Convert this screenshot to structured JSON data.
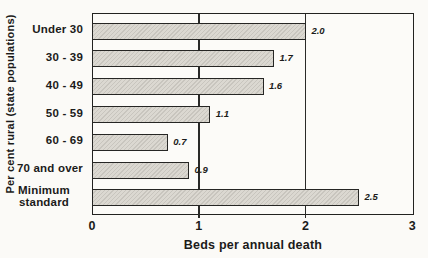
{
  "colors": {
    "paper": "#fbfaf7",
    "ink": "#1e1e1e",
    "bar_fill": "#dbd8d1",
    "bar_hatch": "#c8c5be",
    "bar_border": "#262624"
  },
  "chart_data": {
    "type": "bar",
    "orientation": "horizontal",
    "title": "",
    "categories": [
      "Under 30",
      "30 - 39",
      "40 - 49",
      "50 - 59",
      "60 - 69",
      "70 and over",
      "Minimum standard"
    ],
    "values": [
      2.0,
      1.7,
      1.6,
      1.1,
      0.7,
      0.9,
      2.5
    ],
    "value_labels": [
      "2.0",
      "1.7",
      "1.6",
      "1.1",
      "0.7",
      "0.9",
      "2.5"
    ],
    "xlabel": "Beds per annual death",
    "ylabel": "Per cent rural (state populations)",
    "xlim": [
      0,
      3
    ],
    "xticks": [
      0,
      1,
      2,
      3
    ],
    "gridlines_x": [
      1,
      2
    ],
    "legend": "none",
    "grid": "vertical gridlines at x=1 and x=2, bars drawn over gridlines"
  }
}
